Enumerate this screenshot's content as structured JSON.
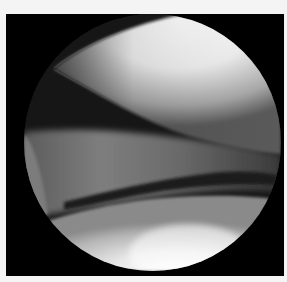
{
  "image": {
    "description": "Arthroscopic endoscope view inside a joint, shown in a circular viewport on a black frame",
    "frame_color": "#000000",
    "page_background": "#f4f4f4",
    "regions": [
      {
        "name": "upper-condyle-surface",
        "tone": "bright white-gray",
        "color": "#eeeeee"
      },
      {
        "name": "joint-space-shadow",
        "tone": "dark",
        "color": "#141414"
      },
      {
        "name": "meniscus-band",
        "tone": "mid gray",
        "color": "#6e6e6e"
      },
      {
        "name": "lower-plateau-surface",
        "tone": "light gray to white",
        "color": "#d8d8d8"
      },
      {
        "name": "left-edge-structure",
        "tone": "gray sliver",
        "color": "#7a7a7a"
      }
    ]
  }
}
